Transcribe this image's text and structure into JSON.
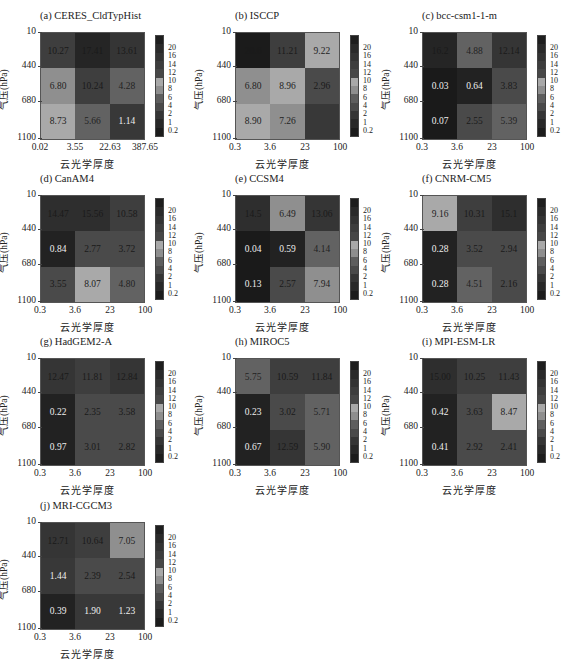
{
  "chart_data": [
    {
      "type": "heatmap",
      "title": "(a) CERES_CldTypHist",
      "xlabel": "云光学厚度",
      "ylabel": "气压(hPa)",
      "x_ticks": [
        "0.02",
        "3.55",
        "22.63",
        "387.65"
      ],
      "y_ticks": [
        "10",
        "440",
        "680",
        "1100"
      ],
      "values": [
        [
          10.27,
          17.41,
          13.61
        ],
        [
          6.8,
          10.24,
          4.28
        ],
        [
          8.73,
          5.66,
          1.14
        ]
      ]
    },
    {
      "type": "heatmap",
      "title": "(b) ISCCP",
      "xlabel": "云光学厚度",
      "ylabel": "气压(hPa)",
      "x_ticks": [
        "0.3",
        "3.6",
        "23",
        "100"
      ],
      "y_ticks": [
        "10",
        "440",
        "680",
        "1100"
      ],
      "values": [
        [
          20.6,
          11.21,
          9.22
        ],
        [
          6.8,
          8.96,
          2.96
        ],
        [
          8.9,
          7.26,
          1.5
        ]
      ]
    },
    {
      "type": "heatmap",
      "title": "(c) bcc-csm1-1-m",
      "xlabel": "云光学厚度",
      "ylabel": "气压(hPa)",
      "x_ticks": [
        "0.3",
        "3.6",
        "23",
        "100"
      ],
      "y_ticks": [
        "10",
        "440",
        "680",
        "1100"
      ],
      "values": [
        [
          16.2,
          4.88,
          12.14
        ],
        [
          0.03,
          0.64,
          3.83
        ],
        [
          0.07,
          2.55,
          5.39
        ]
      ]
    },
    {
      "type": "heatmap",
      "title": "(d) CanAM4",
      "xlabel": "云光学厚度",
      "ylabel": "气压(hPa)",
      "x_ticks": [
        "0.3",
        "3.6",
        "23",
        "100"
      ],
      "y_ticks": [
        "10",
        "440",
        "680",
        "1100"
      ],
      "values": [
        [
          14.47,
          15.56,
          10.58
        ],
        [
          0.84,
          2.77,
          3.72
        ],
        [
          3.55,
          8.07,
          4.8
        ]
      ]
    },
    {
      "type": "heatmap",
      "title": "(e) CCSM4",
      "xlabel": "云光学厚度",
      "ylabel": "气压(hPa)",
      "x_ticks": [
        "0.3",
        "3.6",
        "23",
        "100"
      ],
      "y_ticks": [
        "10",
        "440",
        "680",
        "1100"
      ],
      "values": [
        [
          14.5,
          6.49,
          13.06
        ],
        [
          0.04,
          0.59,
          4.14
        ],
        [
          0.13,
          2.57,
          7.94
        ]
      ]
    },
    {
      "type": "heatmap",
      "title": "(f) CNRM-CM5",
      "xlabel": "云光学厚度",
      "ylabel": "气压(hPa)",
      "x_ticks": [
        "0.3",
        "3.6",
        "23",
        "100"
      ],
      "y_ticks": [
        "10",
        "440",
        "680",
        "1100"
      ],
      "values": [
        [
          9.16,
          10.31,
          15.1
        ],
        [
          0.28,
          3.52,
          2.94
        ],
        [
          0.28,
          4.51,
          2.16
        ]
      ]
    },
    {
      "type": "heatmap",
      "title": "(g) HadGEM2-A",
      "xlabel": "云光学厚度",
      "ylabel": "气压(hPa)",
      "x_ticks": [
        "0.3",
        "3.6",
        "23",
        "100"
      ],
      "y_ticks": [
        "10",
        "440",
        "680",
        "1100"
      ],
      "values": [
        [
          12.47,
          11.81,
          12.84
        ],
        [
          0.22,
          2.35,
          3.58
        ],
        [
          0.97,
          3.01,
          2.82
        ]
      ]
    },
    {
      "type": "heatmap",
      "title": "(h) MIROC5",
      "xlabel": "云光学厚度",
      "ylabel": "气压(hPa)",
      "x_ticks": [
        "0.3",
        "3.6",
        "23",
        "100"
      ],
      "y_ticks": [
        "10",
        "440",
        "680",
        "1100"
      ],
      "values": [
        [
          5.75,
          10.59,
          11.84
        ],
        [
          0.23,
          3.02,
          5.71
        ],
        [
          0.67,
          12.59,
          5.9
        ]
      ]
    },
    {
      "type": "heatmap",
      "title": "(i) MPI-ESM-LR",
      "xlabel": "云光学厚度",
      "ylabel": "气压(hPa)",
      "x_ticks": [
        "0.3",
        "3.6",
        "23",
        "100"
      ],
      "y_ticks": [
        "10",
        "440",
        "680",
        "1100"
      ],
      "values": [
        [
          15.0,
          10.25,
          11.43
        ],
        [
          0.42,
          3.63,
          8.47
        ],
        [
          0.41,
          2.92,
          2.41
        ]
      ]
    },
    {
      "type": "heatmap",
      "title": "(j) MRI-CGCM3",
      "xlabel": "云光学厚度",
      "ylabel": "气压(hPa)",
      "x_ticks": [
        "0.3",
        "3.6",
        "23",
        "100"
      ],
      "y_ticks": [
        "10",
        "440",
        "680",
        "1100"
      ],
      "values": [
        [
          12.71,
          10.64,
          7.05
        ],
        [
          1.44,
          2.39,
          2.54
        ],
        [
          0.39,
          1.9,
          1.23
        ]
      ]
    }
  ],
  "colorbar": {
    "ticks": [
      "20",
      "16",
      "14",
      "12",
      "10",
      "8",
      "6",
      "4",
      "2",
      "1",
      "0.2"
    ],
    "levels": [
      "#1e1e1e",
      "#2a2a2a",
      "#333333",
      "#3d3d3d",
      "#474747",
      "#a8a8a8",
      "#8e8e8e",
      "#5e5e5e",
      "#4a4a4a",
      "#353535",
      "#282828",
      "#1c1c1c"
    ]
  },
  "cells": [
    {
      "text": [
        "10.27",
        "17.41",
        "13.61",
        "6.80",
        "10.24",
        "4.28",
        "8.73",
        "5.66",
        "1.14"
      ]
    },
    {
      "text": [
        "20.6",
        "11.21",
        "9.22",
        "6.80",
        "8.96",
        "2.96",
        "8.90",
        "7.26",
        ""
      ]
    },
    {
      "text": [
        "16.2",
        "4.88",
        "12.14",
        "0.03",
        "0.64",
        "3.83",
        "0.07",
        "2.55",
        "5.39"
      ]
    },
    {
      "text": [
        "14.47",
        "15.56",
        "10.58",
        "0.84",
        "2.77",
        "3.72",
        "3.55",
        "8.07",
        "4.80"
      ]
    },
    {
      "text": [
        "14.5",
        "6.49",
        "13.06",
        "0.04",
        "0.59",
        "4.14",
        "0.13",
        "2.57",
        "7.94"
      ]
    },
    {
      "text": [
        "9.16",
        "10.31",
        "15.1",
        "0.28",
        "3.52",
        "2.94",
        "0.28",
        "4.51",
        "2.16"
      ]
    },
    {
      "text": [
        "12.47",
        "11.81",
        "12.84",
        "0.22",
        "2.35",
        "3.58",
        "0.97",
        "3.01",
        "2.82"
      ]
    },
    {
      "text": [
        "5.75",
        "10.59",
        "11.84",
        "0.23",
        "3.02",
        "5.71",
        "0.67",
        "12.59",
        "5.90"
      ]
    },
    {
      "text": [
        "15.00",
        "10.25",
        "11.43",
        "0.42",
        "3.63",
        "8.47",
        "0.41",
        "2.92",
        "2.41"
      ]
    },
    {
      "text": [
        "12.71",
        "10.64",
        "7.05",
        "1.44",
        "2.39",
        "2.54",
        "0.39",
        "1.90",
        "1.23"
      ]
    }
  ]
}
